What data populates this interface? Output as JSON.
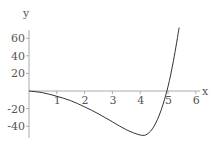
{
  "chart_data": {
    "type": "line",
    "title": "",
    "xlabel": "x",
    "ylabel": "y",
    "xlim": [
      0,
      6.3
    ],
    "ylim": [
      -55,
      75
    ],
    "x_ticks": [
      1,
      2,
      3,
      4,
      5,
      6
    ],
    "y_ticks": [
      -40,
      -20,
      20,
      40,
      60
    ],
    "grid": false,
    "legend": null,
    "series": [
      {
        "name": "curve",
        "x": [
          0,
          0.5,
          1,
          1.5,
          2,
          2.5,
          3,
          3.5,
          4,
          4.25,
          4.5,
          4.75,
          5,
          5.2,
          5.4
        ],
        "y": [
          0,
          -2,
          -6,
          -11,
          -18,
          -26,
          -35,
          -44,
          -50,
          -49,
          -40,
          -22,
          5,
          35,
          72
        ]
      }
    ],
    "colors": {
      "axis": "#aaaaaa",
      "curve": "#333333",
      "text": "#555555"
    }
  },
  "labels": {
    "x_axis": "x",
    "y_axis": "y",
    "x_tick_labels": [
      "1",
      "2",
      "3",
      "4",
      "5",
      "6"
    ],
    "y_tick_labels": [
      "60",
      "40",
      "20",
      "-20",
      "-40"
    ]
  }
}
